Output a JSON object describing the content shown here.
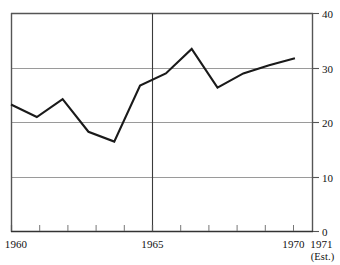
{
  "chart_data": {
    "type": "line",
    "title": "",
    "subtitle": "",
    "xlabel": "",
    "ylabel": "",
    "x": [
      1960,
      1961,
      1962,
      1963,
      1964,
      1965,
      1966,
      1967,
      1968,
      1969,
      1970,
      1971
    ],
    "values": [
      23.3,
      21.0,
      24.3,
      18.3,
      16.5,
      26.8,
      29.0,
      33.5,
      26.4,
      29.0,
      30.5,
      31.8
    ],
    "series": [
      {
        "name": "",
        "values": [
          23.3,
          21.0,
          24.3,
          18.3,
          16.5,
          26.8,
          29.0,
          33.5,
          26.4,
          29.0,
          30.5,
          31.8
        ]
      }
    ],
    "xlim": [
      1960,
      1971.7
    ],
    "ylim": [
      0,
      40
    ],
    "y_ticks": [
      0,
      10,
      20,
      30,
      40
    ],
    "y_tick_labels": [
      "0",
      "10",
      "20",
      "30",
      "40"
    ],
    "x_ticks": [
      1960,
      1961,
      1962,
      1963,
      1964,
      1965,
      1966,
      1967,
      1968,
      1969,
      1970,
      1971
    ],
    "x_tick_labels_shown": [
      "1960",
      "1965",
      "1970",
      "1971"
    ],
    "x_labeled_ticks": [
      1960,
      1965,
      1970,
      1971
    ],
    "annotations": [
      "(Est.)"
    ],
    "grid": "horizontal",
    "legend": "none",
    "reference_line_x": 1965,
    "line_color": "#1a1a1a",
    "grid_color": "#9a9a9a",
    "axis_color": "#4a4a4a"
  },
  "axes": {
    "y_labels": [
      {
        "text": "40",
        "value": 40
      },
      {
        "text": "30",
        "value": 30
      },
      {
        "text": "20",
        "value": 20
      },
      {
        "text": "10",
        "value": 10
      },
      {
        "text": "0",
        "value": 0
      }
    ],
    "x_labels": [
      {
        "text": "1960",
        "value": 1960
      },
      {
        "text": "1965",
        "value": 1965
      },
      {
        "text": "1970",
        "value": 1970
      },
      {
        "text": "1971",
        "value": 1971
      }
    ],
    "estimate_note": "(Est.)"
  }
}
